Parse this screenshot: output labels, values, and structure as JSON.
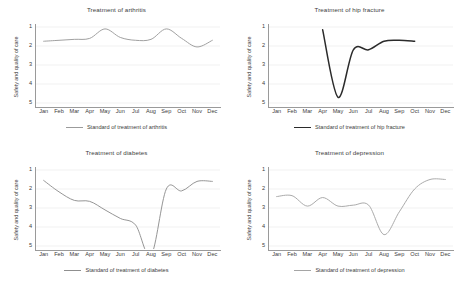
{
  "figure": {
    "panel_count": 4,
    "background": "#ffffff"
  },
  "axis": {
    "ylabel": "Safety and quality of care",
    "yticks": [
      "1",
      "2",
      "3",
      "4",
      "5"
    ],
    "months": [
      "Jan",
      "Feb",
      "Mar",
      "Apr",
      "May",
      "Jun",
      "Jul",
      "Aug",
      "Sep",
      "Oct",
      "Nov",
      "Dec"
    ]
  },
  "panels": [
    {
      "title": "Treatment of arthritis",
      "legend": "Standard of treatment of arthritis",
      "color": "#9b9b9b"
    },
    {
      "title": "Treatment of hip fracture",
      "legend": "Standard of treatment of hip fracture",
      "color": "#2b2b2b"
    },
    {
      "title": "Treatment of diabetes",
      "legend": "Standard of treatment of diabetes",
      "color": "#8f8f8f"
    },
    {
      "title": "Treatment  of depression",
      "legend": "Standard of treatment of depression",
      "color": "#a5a5a5"
    }
  ],
  "chart_data": [
    {
      "type": "line",
      "title": "Treatment of arthritis",
      "xlabel": "",
      "ylabel": "Safety and quality of care",
      "categories": [
        "Jan",
        "Feb",
        "Mar",
        "Apr",
        "May",
        "Jun",
        "Jul",
        "Aug",
        "Sep",
        "Oct",
        "Nov",
        "Dec"
      ],
      "ylim": [
        1,
        5
      ],
      "y_inverted": true,
      "grid": true,
      "legend_position": "bottom",
      "series": [
        {
          "name": "Standard of treatment of arthritis",
          "color": "#9b9b9b",
          "values": [
            1.75,
            1.7,
            1.65,
            1.6,
            1.1,
            1.55,
            1.7,
            1.65,
            1.1,
            1.6,
            2.05,
            1.7
          ]
        }
      ]
    },
    {
      "type": "line",
      "title": "Treatment of hip fracture",
      "xlabel": "",
      "ylabel": "Safety and quality of care",
      "categories": [
        "Jan",
        "Feb",
        "Mar",
        "Apr",
        "May",
        "Jun",
        "Jul",
        "Aug",
        "Sep",
        "Oct",
        "Nov",
        "Dec"
      ],
      "ylim": [
        1,
        5
      ],
      "y_inverted": true,
      "grid": true,
      "legend_position": "bottom",
      "series": [
        {
          "name": "Standard of treatment of hip fracture",
          "color": "#2b2b2b",
          "values": [
            null,
            null,
            null,
            1.15,
            4.7,
            2.2,
            2.2,
            1.75,
            1.7,
            1.75,
            null,
            null
          ]
        }
      ]
    },
    {
      "type": "line",
      "title": "Treatment of diabetes",
      "xlabel": "",
      "ylabel": "Safety and quality of care",
      "categories": [
        "Jan",
        "Feb",
        "Mar",
        "Apr",
        "May",
        "Jun",
        "Jul",
        "Aug",
        "Sep",
        "Oct",
        "Nov",
        "Dec"
      ],
      "ylim": [
        1,
        5
      ],
      "y_inverted": true,
      "grid": true,
      "legend_position": "bottom",
      "series": [
        {
          "name": "Standard of treatment of diabetes",
          "color": "#8f8f8f",
          "values": [
            1.55,
            2.15,
            2.6,
            2.65,
            3.1,
            3.55,
            3.9,
            5.5,
            2.0,
            2.1,
            1.6,
            1.6
          ]
        }
      ]
    },
    {
      "type": "line",
      "title": "Treatment  of depression",
      "xlabel": "",
      "ylabel": "Safety and quality of care",
      "categories": [
        "Jan",
        "Feb",
        "Mar",
        "Apr",
        "May",
        "Jun",
        "Jul",
        "Aug",
        "Sep",
        "Oct",
        "Nov",
        "Dec"
      ],
      "ylim": [
        1,
        5
      ],
      "y_inverted": true,
      "grid": true,
      "legend_position": "bottom",
      "series": [
        {
          "name": "Standard of treatment of depression",
          "color": "#a5a5a5",
          "values": [
            2.4,
            2.35,
            2.9,
            2.45,
            2.9,
            2.85,
            2.85,
            4.4,
            3.2,
            2.0,
            1.5,
            1.5
          ]
        }
      ]
    }
  ]
}
